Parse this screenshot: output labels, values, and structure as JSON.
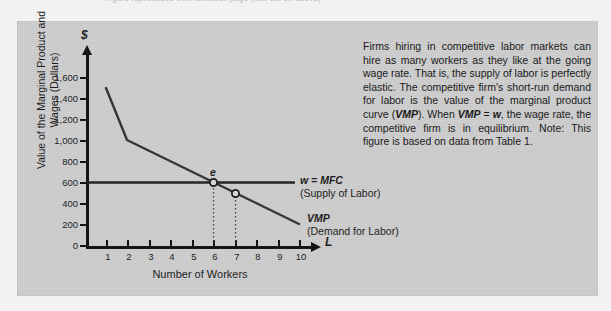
{
  "top_cut_text": "Figure reproduced from textbook page (text cut off above)",
  "chart_data": {
    "type": "line",
    "title": "",
    "xlabel": "Number of Workers",
    "ylabel": "Value of the Marginal Product and Wages (Dollars)",
    "x_axis_symbol": "L",
    "y_axis_symbol": "$",
    "xlim": [
      0,
      10.6
    ],
    "ylim": [
      0,
      1700
    ],
    "grid": false,
    "legend_position": "inline-right",
    "x_ticks": [
      "1",
      "2",
      "3",
      "4",
      "5",
      "6",
      "7",
      "8",
      "9",
      "10"
    ],
    "y_ticks": [
      "0",
      "200",
      "400",
      "600",
      "800",
      "1,000",
      "1,200",
      "1,400",
      "1,600"
    ],
    "series": [
      {
        "name": "VMP",
        "label_line1": "VMP",
        "label_line2": "(Demand for Labor)",
        "x": [
          1,
          2,
          10
        ],
        "values": [
          1500,
          1000,
          200
        ]
      },
      {
        "name": "w = MFC",
        "label_line1": "w = MFC",
        "label_line2": "(Supply of Labor)",
        "x": [
          0,
          10
        ],
        "values": [
          600,
          600
        ]
      }
    ],
    "annotations": [
      {
        "name": "equilibrium-point",
        "label": "e",
        "x": 6,
        "y": 600,
        "marker": "open-circle",
        "dropline": "dotted"
      },
      {
        "name": "secondary-point",
        "label": "",
        "x": 7,
        "y": 500,
        "marker": "open-circle",
        "dropline": "dotted"
      }
    ]
  },
  "side_note": {
    "paragraph": "Firms hiring in competitive labor markets can hire as many workers as they like at the going wage rate. That is, the supply of labor is perfectly elastic. The competitive firm's short-run demand for labor is the value of the marginal product curve (VMP). When VMP = w, the wage rate, the competitive firm is in equilibrium. Note: This figure is based on data from Table 1."
  },
  "colors": {
    "panel_background": "#cdcdcd",
    "page_background": "#f2f2f2",
    "ink": "#1a1a1a",
    "curve": "#333333"
  }
}
